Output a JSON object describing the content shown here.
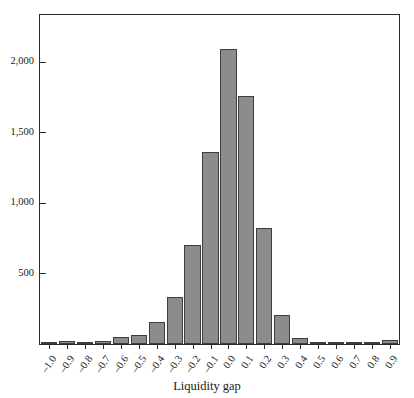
{
  "chart_data": {
    "type": "bar",
    "title": "",
    "subtitle": "",
    "xlabel": "Liquidity gap",
    "ylabel": "",
    "categories": [
      "-1.0",
      "-0.9",
      "-0.8",
      "-0.7",
      "-0.6",
      "-0.5",
      "-0.4",
      "-0.3",
      "-0.2",
      "-0.1",
      "0.0",
      "0.1",
      "0.2",
      "0.3",
      "0.4",
      "0.5",
      "0.6",
      "0.7",
      "0.8",
      "0.9"
    ],
    "values": [
      12,
      20,
      14,
      20,
      48,
      65,
      155,
      335,
      700,
      1360,
      2090,
      1755,
      820,
      205,
      40,
      10,
      2,
      2,
      2,
      28
    ],
    "xlim": [
      -1.05,
      0.95
    ],
    "ylim": [
      0,
      2330
    ],
    "yticks": [
      500,
      1000,
      1500,
      2000
    ],
    "ytick_labels": [
      "500",
      "1,000",
      "1,500",
      "2,000"
    ],
    "grid": false,
    "legend": null,
    "bar_color": "#8c8c8c",
    "bar_edge_color": "#3d3d3d",
    "axis_color": "#2b2b2b",
    "background": "#ffffff"
  },
  "axes": {
    "x_title": "Liquidity gap"
  }
}
